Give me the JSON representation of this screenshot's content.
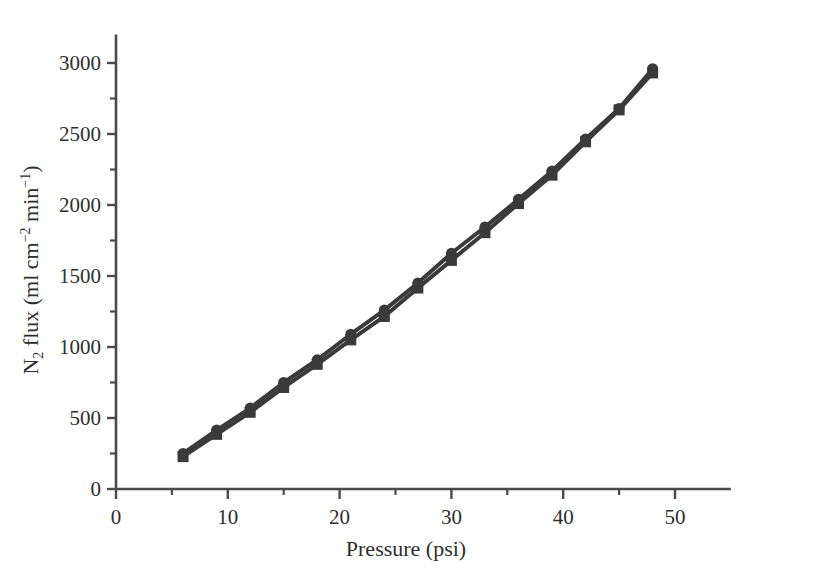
{
  "chart_data": {
    "type": "line",
    "title": "",
    "subtitle": "",
    "xlabel": "Pressure (psi)",
    "ylabel": "N2 flux (ml cm-2 min-1)",
    "ylabel_parts": {
      "lead": "N",
      "lead_sub": "2",
      "mid": " flux (ml cm",
      "exp1": "−2",
      "mid2": " min",
      "exp2": "−1",
      "tail": ")"
    },
    "xlim": [
      0,
      55
    ],
    "ylim": [
      0,
      3200
    ],
    "xticks": [
      0,
      10,
      20,
      30,
      40,
      50
    ],
    "xtick_labels": [
      "0",
      "10",
      "20",
      "30",
      "40",
      "50"
    ],
    "xminor_ticks": [
      5,
      15,
      25,
      35,
      45
    ],
    "yticks": [
      0,
      500,
      1000,
      1500,
      2000,
      2500,
      3000
    ],
    "ytick_labels": [
      "0",
      "500",
      "1000",
      "1500",
      "2000",
      "2500",
      "3000"
    ],
    "yminor_ticks": [
      250,
      750,
      1250,
      1750,
      2250,
      2750
    ],
    "grid": false,
    "legend": "none",
    "x": [
      6,
      9,
      12,
      15,
      18,
      21,
      24,
      27,
      30,
      33,
      36,
      39,
      42,
      45,
      48
    ],
    "series": [
      {
        "name": "Series 1",
        "marker": "circle",
        "color": "#3a3a3a",
        "values": [
          250,
          415,
          570,
          750,
          910,
          1090,
          1260,
          1450,
          1660,
          1845,
          2040,
          2240,
          2465,
          2680,
          2960
        ]
      },
      {
        "name": "Series 2",
        "marker": "square",
        "color": "#3a3a3a",
        "values": [
          228,
          385,
          540,
          715,
          878,
          1050,
          1215,
          1415,
          1610,
          1805,
          2010,
          2210,
          2445,
          2670,
          2930
        ]
      }
    ],
    "axis_color": "#4a4a4a",
    "marker_size": 11,
    "line_width": 4
  }
}
